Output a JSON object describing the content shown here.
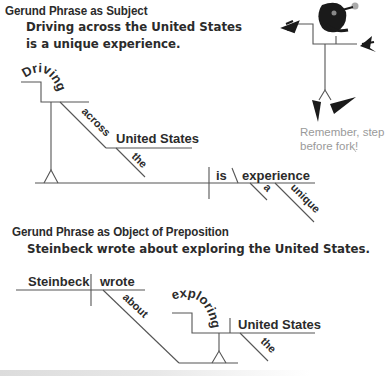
{
  "section1": {
    "heading": "Gerund Phrase as Subject",
    "example_line1": "Driving across the United States",
    "example_line2": "is a unique experience.",
    "diagram": {
      "gerund": "Driving",
      "preposition": "across",
      "object": "United States",
      "object_modifier": "the",
      "verb": "is",
      "complement": "experience",
      "modifier_1": "a",
      "modifier_2": "unique"
    }
  },
  "section2": {
    "heading": "Gerund Phrase as Object of Preposition",
    "example": "Steinbeck wrote about exploring the United States.",
    "diagram": {
      "subject": "Steinbeck",
      "verb": "wrote",
      "preposition": "about",
      "gerund": "exploring",
      "object": "United States",
      "object_modifier": "the"
    }
  },
  "mascot": {
    "icon": "stick-figure-mascot-icon",
    "caption_line1": "Remember, step",
    "caption_line2": "before fork!"
  },
  "colors": {
    "text": "#2b2b2b",
    "lines": "#555555",
    "caption": "#9a9a9a"
  }
}
